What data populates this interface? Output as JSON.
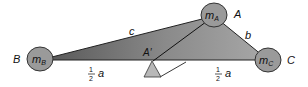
{
  "diagram": {
    "vertices": {
      "A": {
        "label": "A",
        "mass_label": "m",
        "mass_sub": "A"
      },
      "B": {
        "label": "B",
        "mass_label": "m",
        "mass_sub": "B"
      },
      "C": {
        "label": "C",
        "mass_label": "m",
        "mass_sub": "C"
      }
    },
    "sides": {
      "c": "c",
      "b": "b"
    },
    "midpoint_label": "A′",
    "half_segments": [
      {
        "num": "1",
        "den": "2",
        "var": "a"
      },
      {
        "num": "1",
        "den": "2",
        "var": "a"
      }
    ],
    "colors": {
      "triangle_fill_dark": "#6e6e6e",
      "triangle_fill_light": "#b5b5b5",
      "mass_fill": "#9a9a9a",
      "fulcrum_fill": "#b8b8b8",
      "stroke": "#222222"
    }
  }
}
